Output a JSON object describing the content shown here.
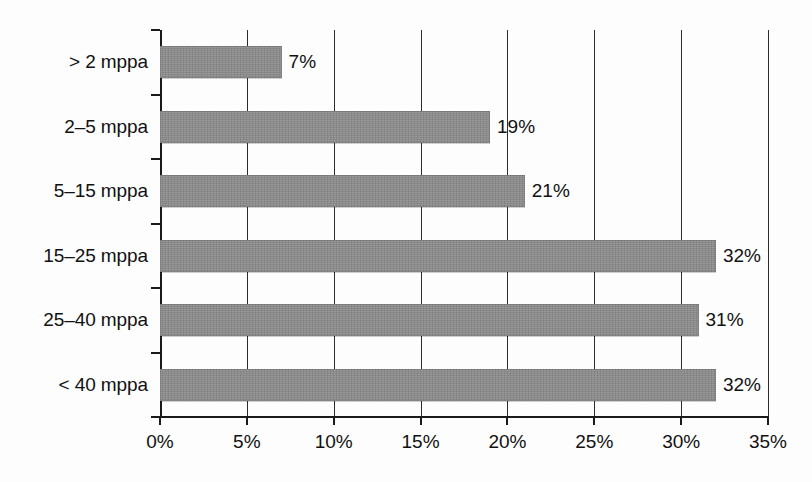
{
  "chart_data": {
    "type": "bar",
    "orientation": "horizontal",
    "title": "",
    "subtitle": "",
    "xlabel": "",
    "ylabel": "",
    "categories": [
      "> 2 mppa",
      "2–5 mppa",
      "5–15 mppa",
      "15–25 mppa",
      "25–40 mppa",
      "< 40 mppa"
    ],
    "values": [
      7,
      19,
      21,
      32,
      31,
      32
    ],
    "value_labels": [
      "7%",
      "19%",
      "21%",
      "32%",
      "31%",
      "32%"
    ],
    "xlim": [
      0,
      35
    ],
    "xticks": [
      0,
      5,
      10,
      15,
      20,
      25,
      30,
      35
    ],
    "xtick_labels": [
      "0%",
      "5%",
      "10%",
      "15%",
      "20%",
      "25%",
      "30%",
      "35%"
    ],
    "grid": "vertical",
    "legend": "none",
    "bar_color": "#8b8b8b",
    "axis_color": "#1a1a1a",
    "background_color": "#fdfdfd"
  }
}
